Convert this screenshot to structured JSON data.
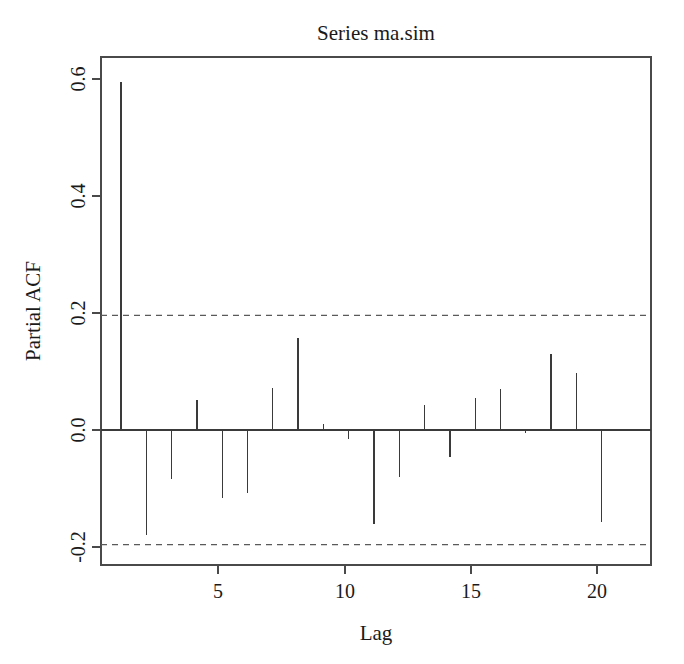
{
  "chart_data": {
    "type": "bar",
    "title": "Series  ma.sim",
    "xlabel": "Lag",
    "ylabel": "Partial ACF",
    "categories": [
      1,
      2,
      3,
      4,
      5,
      6,
      7,
      8,
      9,
      10,
      11,
      12,
      13,
      14,
      15,
      16,
      17,
      18,
      19,
      20
    ],
    "values": [
      0.595,
      -0.179,
      -0.084,
      0.051,
      -0.116,
      -0.108,
      0.072,
      0.158,
      0.01,
      -0.016,
      -0.161,
      -0.08,
      0.043,
      -0.046,
      0.055,
      0.07,
      -0.005,
      0.13,
      0.098,
      -0.157
    ],
    "xlim": [
      0.3,
      20.7
    ],
    "ylim": [
      -0.245,
      0.63
    ],
    "xticks": [
      5,
      10,
      15,
      20
    ],
    "xtick_labels": [
      "5",
      "10",
      "15",
      "20"
    ],
    "yticks": [
      -0.2,
      0.0,
      0.2,
      0.4,
      0.6
    ],
    "ytick_labels": [
      "-0.2",
      "0.0",
      "0.2",
      "0.4",
      "0.6"
    ],
    "grid": false,
    "legend": false,
    "confidence_bounds": [
      0.196,
      -0.196
    ],
    "confidence_style": "dashed",
    "zero_line": 0.0,
    "colors": {
      "spike": "#3a3a3a",
      "frame": "#4a4a4a",
      "confidence": "#5a5a5a",
      "background": "#ffffff",
      "text": "#1a1a1a"
    }
  },
  "figure": {
    "caption_title": "Series  ma.sim",
    "x_axis_title": "Lag",
    "y_axis_title": "Partial ACF"
  }
}
